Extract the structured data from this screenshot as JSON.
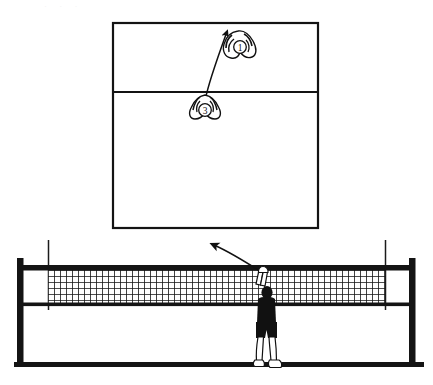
{
  "figure": {
    "kind": "volleyball-instruction-diagram",
    "line_color": "#111111",
    "fill_color": "#ffffff",
    "background": "#ffffff",
    "ghost_scan_text": "· · ·"
  },
  "court_view": {
    "name": "overhead-court-view",
    "label": "",
    "bounds": {
      "x": 113,
      "y": 23,
      "width": 205,
      "height": 205
    },
    "attack_line_y": 92,
    "players": [
      {
        "id": "player-1",
        "number": "1",
        "x": 238,
        "y": 47,
        "role": "setter-target"
      },
      {
        "id": "player-3",
        "number": "3",
        "x": 205,
        "y": 106,
        "role": "attacker"
      }
    ],
    "trajectory": {
      "name": "ball-path-arrow",
      "from": {
        "x": 205,
        "y": 99
      },
      "to": {
        "x": 227,
        "y": 31
      },
      "arrowhead": "at-top"
    }
  },
  "net_view": {
    "name": "net-elevation-view",
    "label": "",
    "ground_line_y": 365,
    "ground_line_x1": 14,
    "ground_line_x2": 424,
    "posts": [
      {
        "id": "post-left",
        "x": 20,
        "top": 258,
        "bottom": 365
      },
      {
        "id": "post-right",
        "x": 413,
        "top": 258,
        "bottom": 365
      }
    ],
    "antennas": [
      {
        "id": "antenna-left",
        "x": 48,
        "top": 240,
        "bottom": 310
      },
      {
        "id": "antenna-right",
        "x": 385,
        "top": 240,
        "bottom": 310
      }
    ],
    "net": {
      "top_band_y": 267,
      "bottom_band_y": 305,
      "mesh_x1": 48,
      "mesh_x2": 385,
      "mesh_cell": 6
    },
    "player": {
      "id": "spiker",
      "x": 263,
      "shirt_color": "#111111",
      "shorts_color": "#111111",
      "skin_color": "#ffffff"
    },
    "trajectory": {
      "name": "spike-path-arrow",
      "from": {
        "x": 262,
        "y": 272
      },
      "to": {
        "x": 208,
        "y": 243
      },
      "arrowhead": "at-upper-left"
    }
  }
}
